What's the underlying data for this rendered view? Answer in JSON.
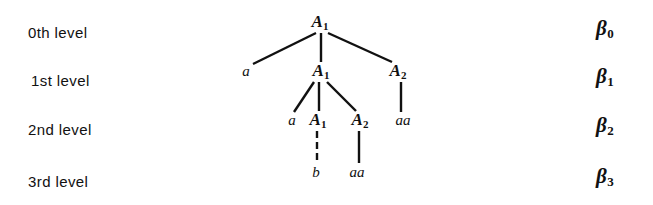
{
  "figure": {
    "background_color": "#ffffff",
    "ink_color": "#111111"
  },
  "row_labels": [
    {
      "text": "0th level",
      "x": 28,
      "y": 25
    },
    {
      "text": "1st level",
      "x": 31,
      "y": 73
    },
    {
      "text": "2nd level",
      "x": 28,
      "y": 122
    },
    {
      "text": "3rd level",
      "x": 28,
      "y": 174
    }
  ],
  "beta_labels": [
    {
      "base": "β",
      "subscript": "0",
      "x": 596,
      "y": 18
    },
    {
      "base": "β",
      "subscript": "1",
      "x": 596,
      "y": 66
    },
    {
      "base": "β",
      "subscript": "2",
      "x": 596,
      "y": 115
    },
    {
      "base": "β",
      "subscript": "3",
      "x": 596,
      "y": 166
    }
  ],
  "tree": {
    "nodes": [
      {
        "id": "n0",
        "base": "A",
        "subscript": "1",
        "kind": "nonterminal",
        "level": 0,
        "x": 320,
        "y": 22
      },
      {
        "id": "n1a",
        "base": "a",
        "subscript": "",
        "kind": "terminal",
        "level": 1,
        "x": 246,
        "y": 71
      },
      {
        "id": "n1A1",
        "base": "A",
        "subscript": "1",
        "kind": "nonterminal",
        "level": 1,
        "x": 321,
        "y": 71
      },
      {
        "id": "n1A2",
        "base": "A",
        "subscript": "2",
        "kind": "nonterminal",
        "level": 1,
        "x": 398,
        "y": 71
      },
      {
        "id": "n2a",
        "base": "a",
        "subscript": "",
        "kind": "terminal",
        "level": 2,
        "x": 292,
        "y": 120
      },
      {
        "id": "n2A1",
        "base": "A",
        "subscript": "1",
        "kind": "nonterminal",
        "level": 2,
        "x": 318,
        "y": 120
      },
      {
        "id": "n2A2",
        "base": "A",
        "subscript": "2",
        "kind": "nonterminal",
        "level": 2,
        "x": 360,
        "y": 120
      },
      {
        "id": "n2aa",
        "base": "aa",
        "subscript": "",
        "kind": "terminal",
        "level": 2,
        "x": 403,
        "y": 120
      },
      {
        "id": "n3b",
        "base": "b",
        "subscript": "",
        "kind": "terminal",
        "level": 3,
        "x": 316,
        "y": 172
      },
      {
        "id": "n3aa",
        "base": "aa",
        "subscript": "",
        "kind": "terminal",
        "level": 3,
        "x": 357,
        "y": 172
      }
    ],
    "edges": [
      {
        "from": "n0",
        "to": "n1a",
        "x1": 316,
        "y1": 33,
        "x2": 253,
        "y2": 64,
        "style": "solid"
      },
      {
        "from": "n0",
        "to": "n1A1",
        "x1": 321,
        "y1": 33,
        "x2": 321,
        "y2": 62,
        "style": "solid"
      },
      {
        "from": "n0",
        "to": "n1A2",
        "x1": 328,
        "y1": 33,
        "x2": 392,
        "y2": 62,
        "style": "solid"
      },
      {
        "from": "n1A1",
        "to": "n2a",
        "x1": 314,
        "y1": 82,
        "x2": 294,
        "y2": 112,
        "style": "solid"
      },
      {
        "from": "n1A1",
        "to": "n2A1",
        "x1": 319,
        "y1": 82,
        "x2": 319,
        "y2": 111,
        "style": "solid"
      },
      {
        "from": "n1A1",
        "to": "n2A2",
        "x1": 327,
        "y1": 82,
        "x2": 356,
        "y2": 111,
        "style": "solid"
      },
      {
        "from": "n1A2",
        "to": "n2aa",
        "x1": 401,
        "y1": 82,
        "x2": 401,
        "y2": 112,
        "style": "solid"
      },
      {
        "from": "n2A1",
        "to": "n3b",
        "x1": 317,
        "y1": 131,
        "x2": 317,
        "y2": 163,
        "style": "dashed"
      },
      {
        "from": "n2A2",
        "to": "n3aa",
        "x1": 359,
        "y1": 131,
        "x2": 359,
        "y2": 163,
        "style": "solid"
      }
    ]
  }
}
